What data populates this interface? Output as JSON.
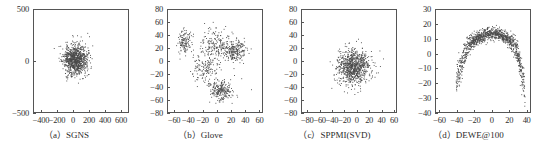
{
  "figure": {
    "panel_count": 4,
    "background": "#ffffff",
    "point_color": "#4a4a4a",
    "axis_color": "#555555"
  },
  "chart_data": [
    {
      "type": "scatter",
      "title": "",
      "caption": "（a）SGNS",
      "caption_label": "(a)",
      "caption_name": "SGNS",
      "xlabel": "",
      "ylabel": "",
      "xlim": [
        -500,
        700
      ],
      "ylim": [
        -500,
        500
      ],
      "xticks": [
        -400,
        -200,
        0,
        200,
        400,
        600
      ],
      "xticklabels": [
        "−400",
        "−200",
        "0",
        "200",
        "400",
        "600"
      ],
      "yticks": [
        -500,
        0,
        500
      ],
      "yticklabels": [
        "−500",
        "0",
        "500"
      ],
      "grid": false,
      "legend": "none",
      "n_points": 900,
      "distribution": "single-gaussian-blob",
      "center": [
        20,
        20
      ],
      "spread": [
        140,
        135
      ],
      "seed": 11
    },
    {
      "type": "scatter",
      "title": "",
      "caption": "（b）Glove",
      "caption_label": "(b)",
      "caption_name": "Glove",
      "xlabel": "",
      "ylabel": "",
      "xlim": [
        -70,
        65
      ],
      "ylim": [
        -80,
        80
      ],
      "xticks": [
        -60,
        -40,
        -20,
        0,
        20,
        40,
        60
      ],
      "xticklabels": [
        "−60",
        "−40",
        "−20",
        "0",
        "20",
        "40",
        "60"
      ],
      "yticks": [
        -80,
        -60,
        -40,
        -20,
        0,
        20,
        40,
        60,
        80
      ],
      "yticklabels": [
        "−80",
        "−60",
        "−40",
        "−20",
        "0",
        "20",
        "40",
        "60",
        "80"
      ],
      "grid": false,
      "legend": "none",
      "n_points": 900,
      "distribution": "multi-cluster",
      "clusters": [
        {
          "center": [
            -46,
            30
          ],
          "spread": [
            7,
            14
          ],
          "weight": 0.14
        },
        {
          "center": [
            5,
            -46
          ],
          "spread": [
            12,
            11
          ],
          "weight": 0.26
        },
        {
          "center": [
            26,
            16
          ],
          "spread": [
            11,
            12
          ],
          "weight": 0.22
        },
        {
          "center": [
            0,
            25
          ],
          "spread": [
            18,
            17
          ],
          "weight": 0.23
        },
        {
          "center": [
            -18,
            -8
          ],
          "spread": [
            14,
            16
          ],
          "weight": 0.15
        }
      ],
      "seed": 27
    },
    {
      "type": "scatter",
      "title": "",
      "caption": "（c）SPPMI(SVD)",
      "caption_label": "(c)",
      "caption_name": "SPPMI(SVD)",
      "xlabel": "",
      "ylabel": "",
      "xlim": [
        -90,
        65
      ],
      "ylim": [
        -80,
        80
      ],
      "xticks": [
        -80,
        -60,
        -40,
        -20,
        0,
        20,
        40,
        60
      ],
      "xticklabels": [
        "−80",
        "−60",
        "−40",
        "−20",
        "0",
        "20",
        "40",
        "60"
      ],
      "yticks": [
        -80,
        -60,
        -40,
        -20,
        0,
        20,
        40,
        60,
        80
      ],
      "yticklabels": [
        "−80",
        "−60",
        "−40",
        "−20",
        "0",
        "20",
        "40",
        "60",
        "80"
      ],
      "grid": false,
      "legend": "none",
      "n_points": 850,
      "distribution": "single-gaussian-blob",
      "center": [
        -6,
        -10
      ],
      "spread": [
        24,
        25
      ],
      "seed": 43
    },
    {
      "type": "scatter",
      "title": "",
      "caption": "（d）DEWE@100",
      "caption_label": "(d)",
      "caption_name": "DEWE@100",
      "xlabel": "",
      "ylabel": "",
      "xlim": [
        -65,
        45
      ],
      "ylim": [
        -40,
        30
      ],
      "xticks": [
        -60,
        -40,
        -20,
        0,
        20,
        40
      ],
      "xticklabels": [
        "−60",
        "−40",
        "−20",
        "0",
        "20",
        "40"
      ],
      "yticks": [
        -40,
        -30,
        -20,
        -10,
        0,
        10,
        20,
        30
      ],
      "yticklabels": [
        "−40",
        "−30",
        "−20",
        "−10",
        "0",
        "10",
        "20",
        "30"
      ],
      "grid": false,
      "legend": "none",
      "n_points": 1100,
      "distribution": "arc",
      "arc": {
        "x_start": -42,
        "x_end": 39,
        "peak_x": 0,
        "peak_y": 14,
        "curvature": -0.011,
        "band": 3.4
      },
      "seed": 61
    }
  ]
}
